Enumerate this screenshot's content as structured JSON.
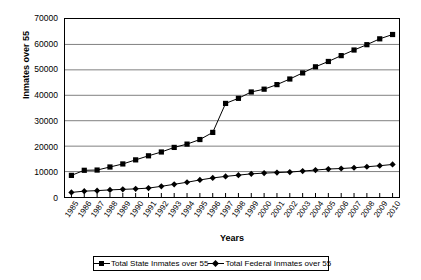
{
  "chart_data": {
    "type": "line",
    "title": "",
    "xlabel": "Years",
    "ylabel": "Inmates over 55",
    "ylim": [
      0,
      70000
    ],
    "ytick_labels": [
      "70000",
      "60000",
      "50000",
      "40000",
      "30000",
      "20000",
      "10000",
      "0"
    ],
    "ytick_values": [
      70000,
      60000,
      50000,
      40000,
      30000,
      20000,
      10000,
      0
    ],
    "grid": true,
    "grid_axis": "y",
    "legend_position": "bottom",
    "categories": [
      "1985",
      "1986",
      "1987",
      "1988",
      "1989",
      "1990",
      "1991",
      "1992",
      "1993",
      "1994",
      "1995",
      "1996",
      "1997",
      "1998",
      "1999",
      "2000",
      "2001",
      "2002",
      "2003",
      "2004",
      "2005",
      "2006",
      "2007",
      "2008",
      "2009",
      "2010"
    ],
    "series": [
      {
        "name": "Total State Inmates over 55",
        "marker": "square",
        "color": "#000000",
        "values": [
          8500,
          10500,
          10600,
          11800,
          13000,
          14600,
          16200,
          17700,
          19500,
          20800,
          22600,
          25400,
          36800,
          38800,
          41300,
          42400,
          44200,
          46400,
          48800,
          51200,
          53300,
          55600,
          57800,
          59900,
          62200,
          63900
        ]
      },
      {
        "name": "Total Federal Inmates over 55",
        "marker": "diamond",
        "color": "#000000",
        "values": [
          1800,
          2300,
          2500,
          2800,
          3000,
          3200,
          3500,
          4200,
          5000,
          5800,
          6700,
          7500,
          8100,
          8600,
          9100,
          9400,
          9600,
          9800,
          10200,
          10600,
          11000,
          11200,
          11500,
          11900,
          12300,
          12800
        ]
      }
    ]
  },
  "legend": {
    "entries": [
      {
        "label": "Total State Inmates over 55"
      },
      {
        "label": "Total Federal Inmates over 55"
      }
    ]
  }
}
